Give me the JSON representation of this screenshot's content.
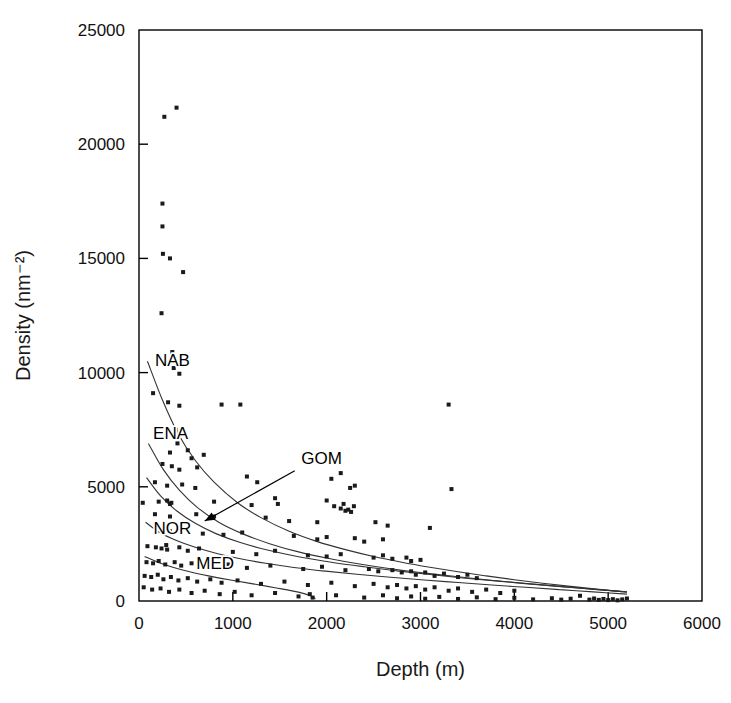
{
  "figure": {
    "background_color": "#ffffff",
    "frame_color": "#000000",
    "marker_color": "#1a1a1a",
    "curve_color": "#333333"
  },
  "chart_data": {
    "type": "scatter",
    "title": "",
    "xlabel": "Depth (m)",
    "ylabel": "Density (nm⁻²)",
    "xlim": [
      0,
      6000
    ],
    "ylim": [
      0,
      25000
    ],
    "xticks": [
      0,
      1000,
      2000,
      3000,
      4000,
      5000,
      6000
    ],
    "yticks": [
      0,
      5000,
      10000,
      15000,
      20000,
      25000
    ],
    "xtick_labels": [
      "0",
      "1000",
      "2000",
      "3000",
      "4000",
      "5000",
      "6000"
    ],
    "ytick_labels": [
      "0",
      "5000",
      "10000",
      "15000",
      "20000",
      "25000"
    ],
    "grid": false,
    "legend": "none",
    "marker_style": "filled-square",
    "marker_size_px": 4,
    "points": [
      [
        270,
        21200
      ],
      [
        400,
        21600
      ],
      [
        250,
        17400
      ],
      [
        250,
        16400
      ],
      [
        255,
        15200
      ],
      [
        330,
        15000
      ],
      [
        470,
        14400
      ],
      [
        240,
        12600
      ],
      [
        355,
        10900
      ],
      [
        360,
        10500
      ],
      [
        370,
        10200
      ],
      [
        430,
        9950
      ],
      [
        150,
        9100
      ],
      [
        310,
        8700
      ],
      [
        430,
        8550
      ],
      [
        880,
        8600
      ],
      [
        1080,
        8600
      ],
      [
        3300,
        8600
      ],
      [
        390,
        7500
      ],
      [
        480,
        7400
      ],
      [
        410,
        6900
      ],
      [
        330,
        6500
      ],
      [
        520,
        6600
      ],
      [
        560,
        6250
      ],
      [
        690,
        6400
      ],
      [
        250,
        6000
      ],
      [
        350,
        5900
      ],
      [
        430,
        5750
      ],
      [
        620,
        5850
      ],
      [
        1150,
        5450
      ],
      [
        1260,
        5200
      ],
      [
        2050,
        5350
      ],
      [
        2150,
        5600
      ],
      [
        170,
        5200
      ],
      [
        300,
        5050
      ],
      [
        460,
        5100
      ],
      [
        600,
        4950
      ],
      [
        2250,
        4950
      ],
      [
        2300,
        5050
      ],
      [
        3330,
        4900
      ],
      [
        40,
        4300
      ],
      [
        210,
        4350
      ],
      [
        300,
        4400
      ],
      [
        330,
        4250
      ],
      [
        345,
        4300
      ],
      [
        800,
        4350
      ],
      [
        1200,
        4200
      ],
      [
        1450,
        4500
      ],
      [
        1480,
        4250
      ],
      [
        2000,
        4400
      ],
      [
        2080,
        4150
      ],
      [
        2150,
        4050
      ],
      [
        2180,
        4250
      ],
      [
        2200,
        3950
      ],
      [
        2230,
        4000
      ],
      [
        2260,
        3900
      ],
      [
        2290,
        4150
      ],
      [
        170,
        3800
      ],
      [
        330,
        3700
      ],
      [
        610,
        3800
      ],
      [
        800,
        3700
      ],
      [
        1350,
        3650
      ],
      [
        1600,
        3500
      ],
      [
        1900,
        3450
      ],
      [
        2520,
        3450
      ],
      [
        2650,
        3300
      ],
      [
        3100,
        3200
      ],
      [
        230,
        3100
      ],
      [
        330,
        3050
      ],
      [
        520,
        3150
      ],
      [
        680,
        2950
      ],
      [
        900,
        2900
      ],
      [
        1100,
        3000
      ],
      [
        1650,
        2850
      ],
      [
        1900,
        2700
      ],
      [
        2000,
        2800
      ],
      [
        2300,
        2750
      ],
      [
        2400,
        2600
      ],
      [
        2600,
        2700
      ],
      [
        90,
        2400
      ],
      [
        180,
        2350
      ],
      [
        240,
        2300
      ],
      [
        290,
        2450
      ],
      [
        300,
        2250
      ],
      [
        430,
        2350
      ],
      [
        520,
        2200
      ],
      [
        640,
        2300
      ],
      [
        1000,
        2150
      ],
      [
        1250,
        2050
      ],
      [
        1450,
        2200
      ],
      [
        1800,
        2000
      ],
      [
        2000,
        1950
      ],
      [
        2150,
        2050
      ],
      [
        2500,
        1900
      ],
      [
        2600,
        2000
      ],
      [
        2700,
        1850
      ],
      [
        2850,
        1900
      ],
      [
        2900,
        1750
      ],
      [
        3000,
        1800
      ],
      [
        80,
        1700
      ],
      [
        150,
        1650
      ],
      [
        210,
        1750
      ],
      [
        280,
        1600
      ],
      [
        380,
        1700
      ],
      [
        450,
        1550
      ],
      [
        560,
        1650
      ],
      [
        700,
        1500
      ],
      [
        950,
        1600
      ],
      [
        1150,
        1450
      ],
      [
        1400,
        1550
      ],
      [
        1750,
        1400
      ],
      [
        1950,
        1500
      ],
      [
        2200,
        1350
      ],
      [
        2450,
        1400
      ],
      [
        2550,
        1300
      ],
      [
        2700,
        1350
      ],
      [
        2800,
        1250
      ],
      [
        2900,
        1300
      ],
      [
        2950,
        1150
      ],
      [
        3050,
        1250
      ],
      [
        3150,
        1100
      ],
      [
        3250,
        1200
      ],
      [
        3400,
        1050
      ],
      [
        3500,
        1150
      ],
      [
        3600,
        1000
      ],
      [
        60,
        1100
      ],
      [
        130,
        1050
      ],
      [
        200,
        1150
      ],
      [
        260,
        950
      ],
      [
        340,
        1050
      ],
      [
        420,
        900
      ],
      [
        520,
        1000
      ],
      [
        620,
        850
      ],
      [
        760,
        950
      ],
      [
        880,
        800
      ],
      [
        1050,
        900
      ],
      [
        1300,
        750
      ],
      [
        1550,
        850
      ],
      [
        1800,
        700
      ],
      [
        2050,
        800
      ],
      [
        2300,
        650
      ],
      [
        2500,
        750
      ],
      [
        2650,
        600
      ],
      [
        2750,
        700
      ],
      [
        2850,
        550
      ],
      [
        2950,
        650
      ],
      [
        3050,
        500
      ],
      [
        3150,
        600
      ],
      [
        3300,
        450
      ],
      [
        3400,
        550
      ],
      [
        3550,
        400
      ],
      [
        3700,
        500
      ],
      [
        3850,
        350
      ],
      [
        4000,
        450
      ],
      [
        50,
        600
      ],
      [
        140,
        500
      ],
      [
        230,
        550
      ],
      [
        320,
        400
      ],
      [
        430,
        500
      ],
      [
        560,
        350
      ],
      [
        700,
        450
      ],
      [
        860,
        300
      ],
      [
        1020,
        400
      ],
      [
        1200,
        250
      ],
      [
        1450,
        350
      ],
      [
        1700,
        200
      ],
      [
        1820,
        300
      ],
      [
        1850,
        150
      ],
      [
        2100,
        250
      ],
      [
        2400,
        150
      ],
      [
        2600,
        250
      ],
      [
        2750,
        120
      ],
      [
        2900,
        200
      ],
      [
        3050,
        100
      ],
      [
        3200,
        180
      ],
      [
        3400,
        90
      ],
      [
        3600,
        160
      ],
      [
        3800,
        80
      ],
      [
        4000,
        140
      ],
      [
        4200,
        70
      ],
      [
        4400,
        120
      ],
      [
        4500,
        60
      ],
      [
        4600,
        100
      ],
      [
        4700,
        230
      ],
      [
        4800,
        60
      ],
      [
        4850,
        110
      ],
      [
        4900,
        50
      ],
      [
        4950,
        90
      ],
      [
        5000,
        40
      ],
      [
        5050,
        80
      ],
      [
        5100,
        30
      ],
      [
        5150,
        70
      ],
      [
        5200,
        110
      ]
    ],
    "curves": [
      {
        "name": "NAB",
        "label": "NAB",
        "label_x": 170,
        "label_y": 10300,
        "points": [
          [
            90,
            10500
          ],
          [
            250,
            8800
          ],
          [
            420,
            7300
          ],
          [
            600,
            6150
          ],
          [
            800,
            5200
          ],
          [
            1050,
            4300
          ],
          [
            1300,
            3650
          ],
          [
            1600,
            3050
          ],
          [
            1900,
            2600
          ],
          [
            2200,
            2250
          ],
          [
            2500,
            1950
          ],
          [
            2800,
            1700
          ],
          [
            3100,
            1480
          ],
          [
            3400,
            1280
          ],
          [
            3700,
            1100
          ],
          [
            4000,
            930
          ],
          [
            4300,
            780
          ],
          [
            4600,
            640
          ],
          [
            4900,
            510
          ],
          [
            5200,
            390
          ]
        ]
      },
      {
        "name": "ENA",
        "label": "ENA",
        "label_x": 150,
        "label_y": 7100,
        "points": [
          [
            100,
            6900
          ],
          [
            260,
            5750
          ],
          [
            430,
            4850
          ],
          [
            620,
            4100
          ],
          [
            850,
            3450
          ],
          [
            1100,
            2950
          ],
          [
            1400,
            2500
          ],
          [
            1700,
            2150
          ],
          [
            2000,
            1880
          ],
          [
            2350,
            1620
          ],
          [
            2700,
            1400
          ],
          [
            3050,
            1220
          ],
          [
            3400,
            1060
          ],
          [
            3750,
            910
          ],
          [
            4100,
            780
          ],
          [
            4450,
            650
          ],
          [
            4800,
            530
          ],
          [
            5150,
            410
          ]
        ]
      },
      {
        "name": "GOM",
        "label": "GOM",
        "label_x": 1730,
        "label_y": 6000,
        "arrow_from": [
          1660,
          5700
        ],
        "arrow_to": [
          700,
          3500
        ],
        "points": [
          [
            80,
            5400
          ],
          [
            230,
            4600
          ],
          [
            400,
            3950
          ],
          [
            600,
            3400
          ],
          [
            820,
            2950
          ],
          [
            1080,
            2560
          ],
          [
            1380,
            2220
          ],
          [
            1700,
            1940
          ],
          [
            2050,
            1700
          ],
          [
            2400,
            1500
          ],
          [
            2750,
            1320
          ],
          [
            3100,
            1160
          ],
          [
            3450,
            1010
          ],
          [
            3800,
            880
          ],
          [
            4150,
            750
          ],
          [
            4500,
            630
          ],
          [
            4850,
            510
          ],
          [
            5200,
            400
          ]
        ]
      },
      {
        "name": "NOR",
        "label": "NOR",
        "label_x": 155,
        "label_y": 2950,
        "points": [
          [
            70,
            3450
          ],
          [
            220,
            3000
          ],
          [
            400,
            2650
          ],
          [
            600,
            2350
          ],
          [
            830,
            2080
          ],
          [
            1080,
            1850
          ],
          [
            1350,
            1650
          ],
          [
            1650,
            1470
          ],
          [
            1980,
            1310
          ],
          [
            2320,
            1170
          ],
          [
            2680,
            1040
          ],
          [
            3040,
            920
          ],
          [
            3400,
            810
          ],
          [
            3760,
            700
          ],
          [
            4120,
            600
          ],
          [
            4480,
            500
          ],
          [
            4840,
            400
          ],
          [
            5200,
            300
          ]
        ]
      },
      {
        "name": "MED",
        "label": "MED",
        "label_x": 610,
        "label_y": 1380,
        "points": [
          [
            60,
            1950
          ],
          [
            200,
            1700
          ],
          [
            360,
            1480
          ],
          [
            540,
            1280
          ],
          [
            740,
            1100
          ],
          [
            960,
            930
          ],
          [
            1200,
            760
          ],
          [
            1450,
            580
          ],
          [
            1700,
            390
          ],
          [
            1830,
            230
          ],
          [
            1880,
            100
          ]
        ]
      }
    ]
  }
}
